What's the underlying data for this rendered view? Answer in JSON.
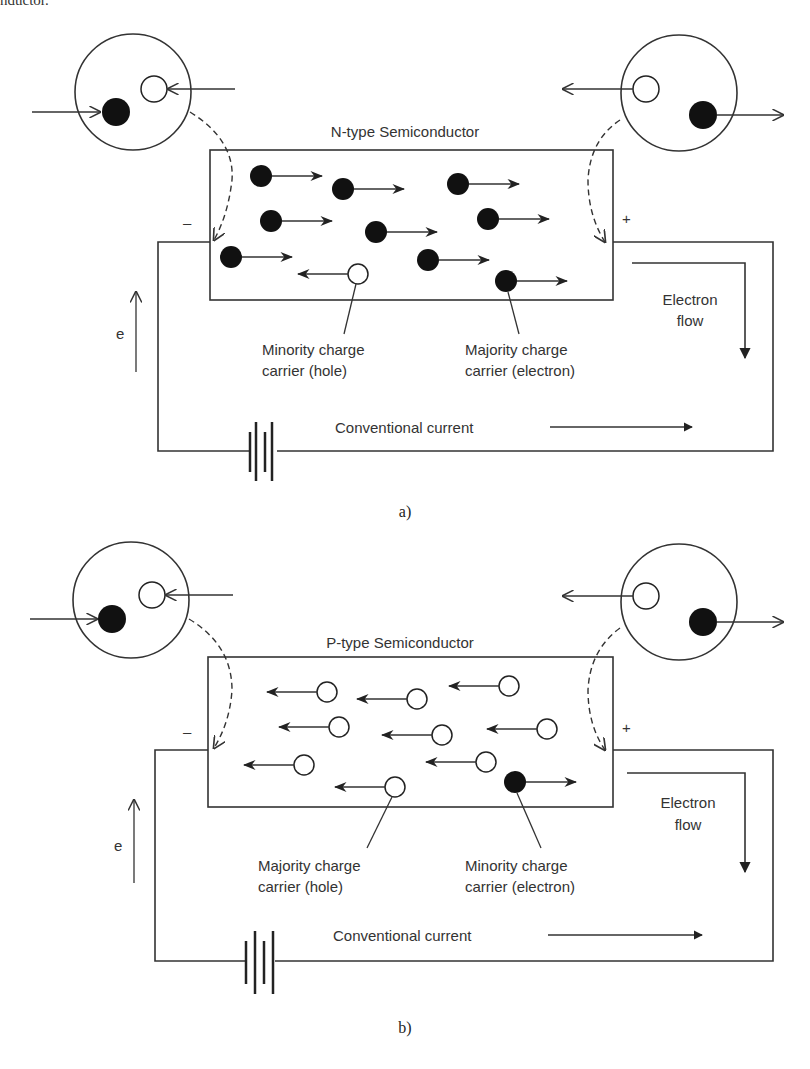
{
  "page": {
    "cropped_top_text": "nductor."
  },
  "colors": {
    "line": "#333333",
    "electron_fill": "#111111",
    "hole_fill": "#ffffff",
    "background": "#ffffff"
  },
  "diagram_a": {
    "title": "N-type Semiconductor",
    "caption": "a)",
    "minus_sign": "–",
    "plus_sign": "+",
    "electron_flow_line1": "Electron",
    "electron_flow_line2": "flow",
    "e_label": "e",
    "left_callout_line1": "Minority charge",
    "left_callout_line2": "carrier (hole)",
    "right_callout_line1": "Majority charge",
    "right_callout_line2": "carrier (electron)",
    "conventional_current": "Conventional current",
    "carriers": {
      "electrons_moving_right": 10,
      "holes_moving_left": 1
    }
  },
  "diagram_b": {
    "title": "P-type Semiconductor",
    "caption": "b)",
    "minus_sign": "–",
    "plus_sign": "+",
    "electron_flow_line1": "Electron",
    "electron_flow_line2": "flow",
    "e_label": "e",
    "left_callout_line1": "Majority charge",
    "left_callout_line2": "carrier (hole)",
    "right_callout_line1": "Minority charge",
    "right_callout_line2": "carrier (electron)",
    "conventional_current": "Conventional current",
    "carriers": {
      "holes_moving_left": 10,
      "electrons_moving_right": 1
    }
  },
  "icons": {
    "contact_circle": "atom-contact-icon",
    "battery": "battery-icon",
    "electron": "filled-circle",
    "hole": "hollow-circle"
  }
}
